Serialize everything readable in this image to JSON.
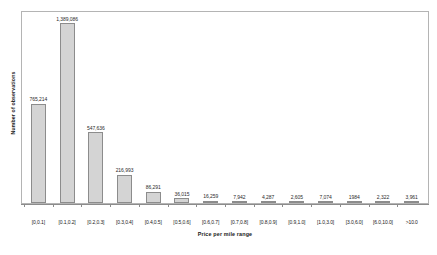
{
  "chart_data": {
    "type": "bar",
    "title": "",
    "xlabel": "Price per mile range",
    "ylabel": "Number of observations",
    "grid": false,
    "legend": "none",
    "ylim": [
      0,
      1389086
    ],
    "categories": [
      "[0,0.1]",
      "[0.1,0.2]",
      "[0.2,0.3]",
      "[0.3,0.4]",
      "[0.4,0.5]",
      "[0.5,0.6]",
      "[0.6,0.7]",
      "[0.7,0.8]",
      "[0.8,0.9]",
      "[0.9,1.0]",
      "[1.0,3.0]",
      "[3.0,6.0]",
      "[6.0,10.0]",
      ">10.0"
    ],
    "values": [
      765214,
      1389086,
      547636,
      216993,
      86291,
      36015,
      16259,
      7942,
      4287,
      2605,
      7074,
      1984,
      2322,
      3961
    ],
    "value_labels": [
      "765,214",
      "1,389,086",
      "547,636",
      "216,993",
      "86,291",
      "36,015",
      "16,259",
      "7,942",
      "4,287",
      "2,605",
      "7,074",
      "1984",
      "2,322",
      "3,961"
    ],
    "colors": {
      "bar_fill": "#d4d4d4",
      "bar_stroke": "#8c8c8c",
      "axis": "#8c8c8c",
      "frame": "#b4b4b4",
      "text": "#1a1a1a"
    }
  }
}
